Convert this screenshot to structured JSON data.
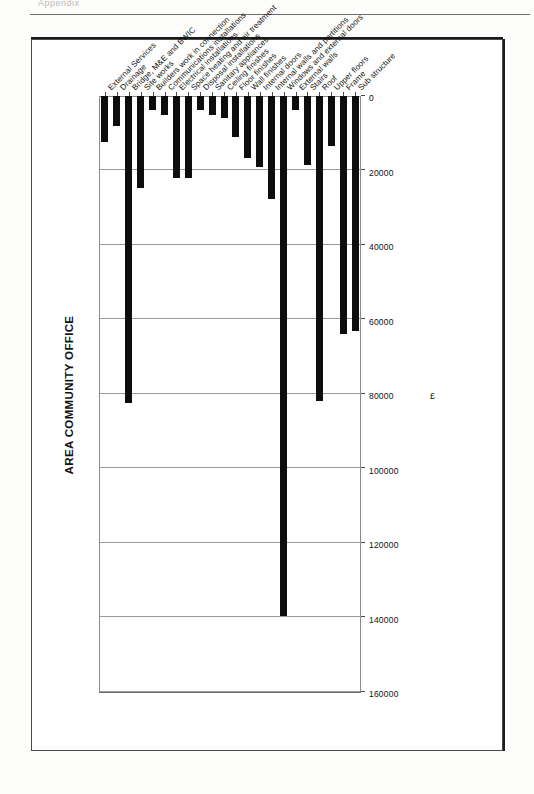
{
  "page": {
    "header_text": "Appendix"
  },
  "chart_data": {
    "type": "bar",
    "orientation": "horizontal",
    "title": "AREA COMMUNITY OFFICE",
    "xlabel": "£",
    "ylabel": "Elements",
    "xlim": [
      0,
      160000
    ],
    "xticks": [
      "0",
      "20000",
      "40000",
      "60000",
      "80000",
      "100000",
      "120000",
      "140000",
      "160000"
    ],
    "grid": true,
    "legend": "none",
    "bar_color": "#0d0d0d",
    "categories": [
      "Sub structure",
      "Frame",
      "Upper floors",
      "Roof",
      "Stairs",
      "External walls",
      "Windows and external doors",
      "Internal walls and partitions",
      "Internal doors",
      "Wall finishes",
      "Floor finishes",
      "Ceiling finishes",
      "Sanitary appliances",
      "Disposal installations",
      "Space heating and air treatment",
      "Electrical installations",
      "Communications installations",
      "Builders work in connection",
      "Site works",
      "Bridge, M&E and BWIC",
      "Drainage",
      "External Services"
    ],
    "values": [
      63000,
      64000,
      13500,
      82000,
      18500,
      3700,
      139500,
      27700,
      19000,
      16600,
      11000,
      6000,
      5000,
      3700,
      22000,
      22000,
      5000,
      3700,
      24600,
      82500,
      8000,
      12300
    ]
  }
}
